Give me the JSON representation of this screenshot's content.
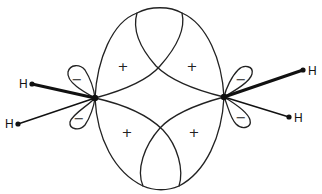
{
  "diagram": {
    "colors": {
      "stroke": "#222222",
      "background": "#ffffff"
    },
    "atoms": [
      {
        "id": "C1",
        "label": "",
        "x": 95,
        "y": 98
      },
      {
        "id": "C2",
        "label": "",
        "x": 224,
        "y": 97
      },
      {
        "id": "H1",
        "label": "H",
        "x": 32,
        "y": 84,
        "bond": "thick",
        "to": "C1"
      },
      {
        "id": "H2",
        "label": "H",
        "x": 18,
        "y": 124,
        "bond": "thin",
        "to": "C1"
      },
      {
        "id": "H3",
        "label": "H",
        "x": 303,
        "y": 70,
        "bond": "thick",
        "to": "C2"
      },
      {
        "id": "H4",
        "label": "H",
        "x": 289,
        "y": 117,
        "bond": "thin",
        "to": "C2"
      }
    ],
    "signs": {
      "plus_top_left": "+",
      "plus_top_right": "+",
      "plus_bottom_left": "+",
      "plus_bottom_right": "+",
      "minus_c1_upper": "−",
      "minus_c1_lower": "−",
      "minus_c2_upper": "−",
      "minus_c2_lower": "−"
    },
    "h_label": "H"
  }
}
